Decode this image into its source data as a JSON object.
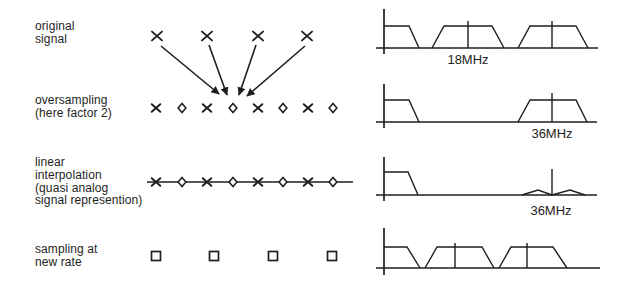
{
  "canvas": {
    "width": 624,
    "height": 288,
    "background": "#ffffff",
    "ink": "#1e1e1e"
  },
  "row_labels": [
    {
      "name": "original-signal",
      "lines": [
        "original",
        "signal"
      ]
    },
    {
      "name": "oversampling",
      "lines": [
        "oversampling",
        "(here factor 2)"
      ]
    },
    {
      "name": "linear-interpolation",
      "lines": [
        "linear",
        "interpolation",
        "(quasi analog",
        "signal represention)"
      ]
    },
    {
      "name": "sampling-at-new-rate",
      "lines": [
        "sampling at",
        "new rate"
      ]
    }
  ],
  "time_domain": {
    "original": {
      "symbol": "cross",
      "y": 36,
      "xs": [
        157,
        207,
        258,
        307
      ]
    },
    "arrows": [
      {
        "x1": 161,
        "y1": 46,
        "x2": 219,
        "y2": 94
      },
      {
        "x1": 209,
        "y1": 45,
        "x2": 227,
        "y2": 95
      },
      {
        "x1": 256,
        "y1": 45,
        "x2": 239,
        "y2": 95
      },
      {
        "x1": 305,
        "y1": 46,
        "x2": 247,
        "y2": 96
      }
    ],
    "oversampled": {
      "y": 108,
      "marks": [
        {
          "symbol": "cross",
          "x": 156
        },
        {
          "symbol": "diamond",
          "x": 182
        },
        {
          "symbol": "cross",
          "x": 207
        },
        {
          "symbol": "diamond",
          "x": 233
        },
        {
          "symbol": "cross",
          "x": 258
        },
        {
          "symbol": "diamond",
          "x": 283
        },
        {
          "symbol": "cross",
          "x": 308
        },
        {
          "symbol": "diamond",
          "x": 333
        }
      ]
    },
    "interpolated": {
      "y": 182,
      "line_x1": 147,
      "line_x2": 353,
      "marks": [
        {
          "symbol": "cross",
          "x": 156
        },
        {
          "symbol": "diamond",
          "x": 182
        },
        {
          "symbol": "cross",
          "x": 207
        },
        {
          "symbol": "diamond",
          "x": 233
        },
        {
          "symbol": "cross",
          "x": 258
        },
        {
          "symbol": "diamond",
          "x": 283
        },
        {
          "symbol": "cross",
          "x": 308
        },
        {
          "symbol": "diamond",
          "x": 333
        }
      ]
    },
    "resampled": {
      "symbol": "square",
      "y": 256,
      "xs": [
        156,
        214,
        273,
        332
      ]
    }
  },
  "spectra": [
    {
      "name": "spectrum-original",
      "label": "18MHz",
      "axis": {
        "x": 384,
        "y_top": 9,
        "y_bottom": 54,
        "baseline_y": 48,
        "x_start": 376,
        "x_end": 598
      },
      "envelope": [
        [
          [
            384,
            26
          ],
          [
            409,
            26
          ],
          [
            419,
            48
          ]
        ],
        [
          [
            432,
            48
          ],
          [
            444,
            26
          ],
          [
            492,
            26
          ],
          [
            504,
            48
          ]
        ],
        [
          [
            518,
            48
          ],
          [
            530,
            26
          ],
          [
            576,
            26
          ],
          [
            588,
            48
          ]
        ]
      ],
      "ticks": [
        {
          "x": 468,
          "y1": 21
        },
        {
          "x": 552,
          "y1": 21
        }
      ]
    },
    {
      "name": "spectrum-oversampled",
      "label": "36MHz",
      "axis": {
        "x": 384,
        "y_top": 84,
        "y_bottom": 128,
        "baseline_y": 122,
        "x_start": 376,
        "x_end": 597
      },
      "envelope": [
        [
          [
            384,
            100
          ],
          [
            409,
            100
          ],
          [
            419,
            122
          ]
        ],
        [
          [
            518,
            122
          ],
          [
            530,
            100
          ],
          [
            576,
            100
          ],
          [
            587,
            122
          ]
        ]
      ],
      "ticks": [
        {
          "x": 552,
          "y1": 93
        }
      ]
    },
    {
      "name": "spectrum-interpolated",
      "label": "36MHz",
      "axis": {
        "x": 384,
        "y_top": 157,
        "y_bottom": 201,
        "baseline_y": 195,
        "x_start": 376,
        "x_end": 597
      },
      "envelope": [
        [
          [
            384,
            172
          ],
          [
            408,
            172
          ],
          [
            418,
            195
          ]
        ],
        [
          [
            522,
            195
          ],
          [
            538,
            190
          ],
          [
            552,
            195
          ],
          [
            570,
            190
          ],
          [
            585,
            195
          ]
        ]
      ],
      "ticks": [
        {
          "x": 552,
          "y1": 169
        }
      ]
    },
    {
      "name": "spectrum-resampled",
      "label": "",
      "axis": {
        "x": 384,
        "y_top": 228,
        "y_bottom": 275,
        "baseline_y": 268,
        "x_start": 376,
        "x_end": 600
      },
      "envelope": [
        [
          [
            384,
            247
          ],
          [
            407,
            247
          ],
          [
            420,
            268
          ]
        ],
        [
          [
            425,
            268
          ],
          [
            437,
            247
          ],
          [
            482,
            247
          ],
          [
            494,
            268
          ]
        ],
        [
          [
            499,
            268
          ],
          [
            511,
            247
          ],
          [
            553,
            247
          ],
          [
            567,
            268
          ]
        ]
      ],
      "ticks": [
        {
          "x": 455,
          "y1": 243
        },
        {
          "x": 527,
          "y1": 243
        }
      ]
    }
  ]
}
